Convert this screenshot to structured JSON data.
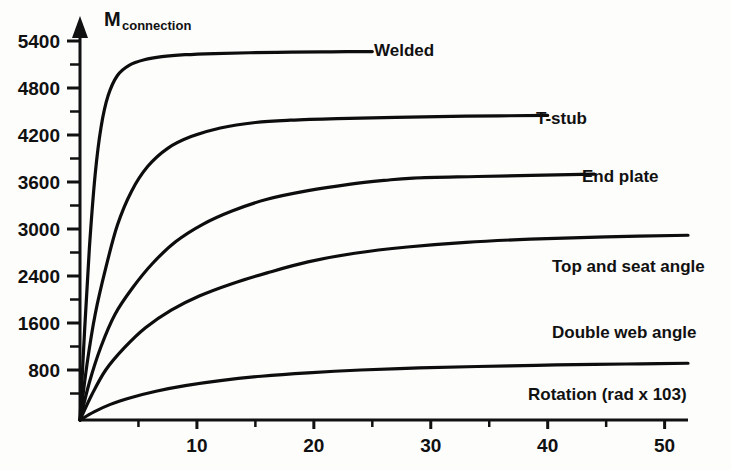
{
  "chart_data": {
    "type": "line",
    "title": "",
    "xlabel": "Rotation (rad x 103)",
    "ylabel": "M",
    "ylabel_sub": "connection",
    "xlim": [
      0,
      52
    ],
    "ylim": [
      0,
      5800
    ],
    "grid": false,
    "legend_position": "inline-right-of-curve-end",
    "x_ticks_major": [
      10,
      20,
      30,
      40,
      50
    ],
    "x_tick_labels": [
      "10",
      "20",
      "30",
      "40",
      "50"
    ],
    "x_ticks_minor": [
      5,
      15,
      25,
      35,
      45
    ],
    "y_ticks_major": [
      800,
      1600,
      2400,
      3000,
      3600,
      4200,
      4800,
      5400
    ],
    "y_tick_labels": [
      "800",
      "1600",
      "2400",
      "3000",
      "3600",
      "4200",
      "4800",
      "5400"
    ],
    "series": [
      {
        "name": "Welded",
        "label": "Welded",
        "plateau_moment": 5250,
        "x_end": 25,
        "x": [
          0,
          0.4,
          0.8,
          1.3,
          1.8,
          2.4,
          3.2,
          4.2,
          5.5,
          7.0,
          9.0,
          11.5,
          14.5,
          18.0,
          21.5,
          25.0
        ],
        "values": [
          0,
          1500,
          2750,
          3700,
          4300,
          4700,
          4960,
          5090,
          5160,
          5200,
          5225,
          5240,
          5250,
          5258,
          5262,
          5265
        ]
      },
      {
        "name": "T-stub",
        "label": "T-stub",
        "plateau_moment": 4400,
        "x_end": 40,
        "x": [
          0,
          0.6,
          1.3,
          2.2,
          3.2,
          4.4,
          5.8,
          7.5,
          9.5,
          12.0,
          15.0,
          18.0,
          22.0,
          27.0,
          33.0,
          40.0
        ],
        "values": [
          0,
          900,
          1750,
          2500,
          3050,
          3480,
          3800,
          4030,
          4180,
          4290,
          4360,
          4390,
          4410,
          4425,
          4440,
          4450
        ]
      },
      {
        "name": "End plate",
        "label": "End plate",
        "plateau_moment": 3650,
        "x_end": 44,
        "x": [
          0,
          0.8,
          1.8,
          3.0,
          4.5,
          6.2,
          8.2,
          10.5,
          13.0,
          16.0,
          19.5,
          23.0,
          26.0,
          28.5,
          34.0,
          44.0
        ],
        "values": [
          0,
          600,
          1200,
          1750,
          2200,
          2560,
          2840,
          3060,
          3230,
          3380,
          3490,
          3570,
          3620,
          3650,
          3670,
          3700
        ]
      },
      {
        "name": "Top and seat angle",
        "label": "Top and seat angle",
        "plateau_moment": 2880,
        "x_end": 52,
        "x": [
          0,
          1.0,
          2.2,
          3.8,
          5.6,
          7.8,
          10.2,
          13.0,
          16.0,
          19.5,
          23.5,
          28.0,
          33.0,
          38.5,
          45.0,
          52.0
        ],
        "values": [
          0,
          400,
          800,
          1180,
          1520,
          1820,
          2060,
          2270,
          2440,
          2580,
          2690,
          2770,
          2830,
          2870,
          2900,
          2920
        ]
      },
      {
        "name": "Double web angle",
        "label": "Double web angle",
        "plateau_moment": 870,
        "x_end": 52,
        "x": [
          0,
          1.2,
          2.6,
          4.4,
          6.5,
          9.0,
          12.0,
          15.5,
          19.5,
          24.0,
          29.0,
          34.0,
          39.0,
          44.0,
          48.0,
          52.0
        ],
        "values": [
          0,
          130,
          250,
          360,
          460,
          550,
          630,
          700,
          755,
          800,
          835,
          860,
          880,
          895,
          905,
          915
        ]
      }
    ]
  },
  "axis": {
    "y_title_main": "M",
    "y_title_sub": "connection",
    "x_title": "Rotation (rad x 103)"
  },
  "colors": {
    "curve": "#0d0d0d",
    "axis": "#111111",
    "text": "#111111",
    "background": "#fdfdfc"
  }
}
